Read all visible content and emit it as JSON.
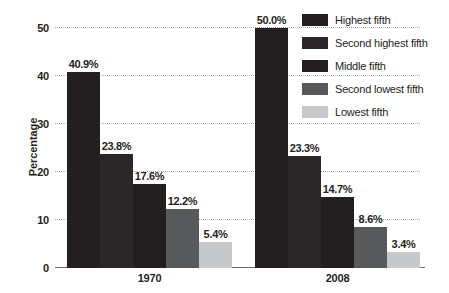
{
  "chart_data": {
    "type": "bar",
    "title": "",
    "subtitle": "",
    "xlabel": "",
    "ylabel": "Percentage",
    "categories": [
      "1970",
      "2008"
    ],
    "ylim": [
      0,
      50
    ],
    "yticks": [
      0,
      10,
      20,
      30,
      40,
      50
    ],
    "ytick_labels": [
      "0",
      "10",
      "20",
      "30",
      "40",
      "50"
    ],
    "grid": true,
    "legend_position": "top-right",
    "series": [
      {
        "name": "Highest fifth",
        "color": "#231f20",
        "values": [
          40.9,
          50.0
        ],
        "labels": [
          "40.9%",
          "50.0%"
        ]
      },
      {
        "name": "Second highest fifth",
        "color": "#2b2728",
        "values": [
          23.8,
          23.3
        ],
        "labels": [
          "23.8%",
          "23.3%"
        ]
      },
      {
        "name": "Middle fifth",
        "color": "#231f20",
        "values": [
          17.6,
          14.7
        ],
        "labels": [
          "17.6%",
          "14.7%"
        ]
      },
      {
        "name": "Second lowest fifth",
        "color": "#58595b",
        "values": [
          12.2,
          8.6
        ],
        "labels": [
          "12.2%",
          "8.6%"
        ]
      },
      {
        "name": "Lowest fifth",
        "color": "#c7c8ca",
        "values": [
          5.4,
          3.4
        ],
        "labels": [
          "5.4%",
          "3.4%"
        ]
      }
    ]
  },
  "axis": {
    "y_title": "Percentage",
    "tick_labels": [
      "50",
      "40",
      "30",
      "20",
      "10",
      "0"
    ]
  },
  "groups": [
    {
      "label": "1970"
    },
    {
      "label": "2008"
    }
  ],
  "legend": {
    "items": [
      {
        "label": "Highest fifth",
        "color": "#231f20"
      },
      {
        "label": "Second highest fifth",
        "color": "#2b2728"
      },
      {
        "label": "Middle fifth",
        "color": "#231f20"
      },
      {
        "label": "Second lowest fifth",
        "color": "#58595b"
      },
      {
        "label": "Lowest fifth",
        "color": "#c7c8ca"
      }
    ]
  }
}
